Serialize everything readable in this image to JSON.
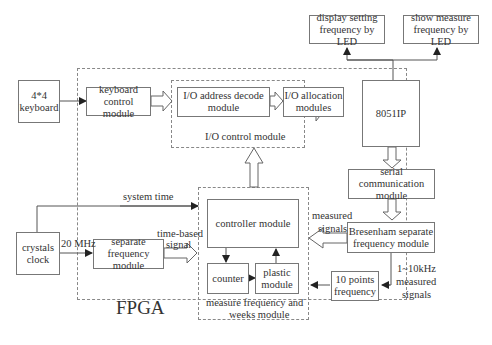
{
  "diagram": {
    "containers": {
      "fpga": {
        "label": "FPGA"
      },
      "io_control": {
        "label": "I/O control module"
      },
      "measure": {
        "label_line1": "measure frequency and",
        "label_line2": "weeks module"
      }
    },
    "boxes": {
      "keyboard": {
        "line1": "4*4",
        "line2": "keyboard"
      },
      "keyboard_control": {
        "line1": "keyboard",
        "line2": "control module"
      },
      "io_address": {
        "line1": "I/O address decode",
        "line2": "module"
      },
      "io_allocation": {
        "line1": "I/O allocation",
        "line2": "modules"
      },
      "cpu": {
        "line1": "8051IP"
      },
      "display_setting": {
        "line1": "display setting",
        "line2": "frequency by LED"
      },
      "show_measure": {
        "line1": "show measure",
        "line2": "frequency by LED"
      },
      "serial_comm": {
        "line1": "serial communication",
        "line2": "module"
      },
      "bresenham": {
        "line1": "Bresenham separate",
        "line2": "frequency module"
      },
      "ten_points": {
        "line1": "10 points",
        "line2": "frequency"
      },
      "crystals": {
        "line1": "crystals",
        "line2": "clock"
      },
      "separate_freq": {
        "line1": "separate",
        "line2": "frequency module"
      },
      "controller": {
        "line1": "controller module"
      },
      "counter": {
        "line1": "counter"
      },
      "plastic": {
        "line1": "plastic",
        "line2": "module"
      }
    },
    "edge_labels": {
      "system_time": "system time",
      "mhz": "20 MHz",
      "time_based_1": "time-based",
      "time_based_2": "signal",
      "measured_1": "measured",
      "measured_2": "signals",
      "khz_1": "1~10kHz",
      "khz_2": "measured",
      "khz_3": "signals"
    },
    "colors": {
      "line": "#555555",
      "border": "#777777",
      "text": "#333333"
    }
  }
}
